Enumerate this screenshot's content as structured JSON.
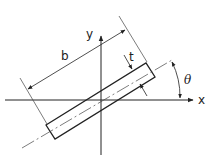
{
  "diagram": {
    "labels": {
      "x_axis": "x",
      "y_axis": "y",
      "length": "b",
      "thickness": "t",
      "angle": "θ"
    },
    "colors": {
      "stroke": "#222222",
      "background": "#ffffff"
    }
  }
}
